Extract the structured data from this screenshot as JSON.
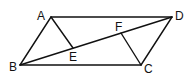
{
  "diagram": {
    "points": {
      "A": {
        "x": 51,
        "y": 17,
        "label": "A",
        "lx": 37,
        "ly": 20
      },
      "B": {
        "x": 20,
        "y": 65,
        "label": "B",
        "lx": 9,
        "ly": 71
      },
      "C": {
        "x": 141,
        "y": 65,
        "label": "C",
        "lx": 144,
        "ly": 73
      },
      "D": {
        "x": 172,
        "y": 17,
        "label": "D",
        "lx": 175,
        "ly": 20
      },
      "E": {
        "x": 73,
        "y": 48,
        "label": "E",
        "lx": 69,
        "ly": 61
      },
      "F": {
        "x": 121,
        "y": 33,
        "label": "F",
        "lx": 115,
        "ly": 31
      }
    },
    "segments": [
      {
        "from": "A",
        "to": "D"
      },
      {
        "from": "D",
        "to": "C"
      },
      {
        "from": "C",
        "to": "B"
      },
      {
        "from": "B",
        "to": "A"
      },
      {
        "from": "B",
        "to": "D"
      },
      {
        "from": "A",
        "to": "E"
      },
      {
        "from": "C",
        "to": "F"
      }
    ],
    "colors": {
      "stroke": "#111111",
      "background": "#ffffff"
    }
  }
}
